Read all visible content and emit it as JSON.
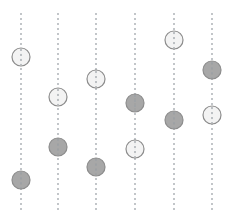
{
  "figure": {
    "title": "",
    "background_color": "#ffffff",
    "width": 234,
    "height": 221
  },
  "style": {
    "line_color": "#9aa0a6",
    "line_dash": "2 3",
    "line_width": 1.2,
    "marker_radius": 9,
    "marker_stroke_color": "#8c8c8c",
    "marker_stroke_width": 1.2,
    "light_fill": "#f2f2f2",
    "dark_fill": "#a0a0a0",
    "line_top": 13,
    "line_bottom": 212
  },
  "chart_data": {
    "type": "scatter",
    "title": "",
    "xlabel": "",
    "ylabel": "",
    "xlim": [
      0,
      234
    ],
    "ylim": [
      0,
      221
    ],
    "grid": false,
    "legend": null,
    "axis_lines": [
      {
        "name": "column-1",
        "x": 21
      },
      {
        "name": "column-2",
        "x": 58
      },
      {
        "name": "column-3",
        "x": 96
      },
      {
        "name": "column-4",
        "x": 135
      },
      {
        "name": "column-5",
        "x": 174
      },
      {
        "name": "column-6",
        "x": 212
      }
    ],
    "series": [
      {
        "name": "light",
        "fill": "#f2f2f2",
        "points": [
          {
            "x": 21,
            "y": 57
          },
          {
            "x": 58,
            "y": 97
          },
          {
            "x": 96,
            "y": 79
          },
          {
            "x": 135,
            "y": 149
          },
          {
            "x": 174,
            "y": 40
          },
          {
            "x": 212,
            "y": 115
          }
        ]
      },
      {
        "name": "dark",
        "fill": "#a0a0a0",
        "points": [
          {
            "x": 21,
            "y": 180
          },
          {
            "x": 58,
            "y": 147
          },
          {
            "x": 96,
            "y": 167
          },
          {
            "x": 135,
            "y": 103
          },
          {
            "x": 174,
            "y": 120
          },
          {
            "x": 212,
            "y": 70
          }
        ]
      }
    ]
  }
}
